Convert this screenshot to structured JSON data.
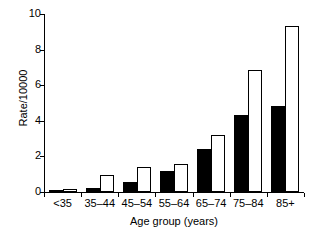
{
  "chart_data": {
    "type": "bar",
    "title": "",
    "xlabel": "Age group (years)",
    "ylabel": "Rate/10000",
    "categories": [
      "<35",
      "35–44",
      "45–54",
      "55–64",
      "65–74",
      "75–84",
      "85+"
    ],
    "series": [
      {
        "name": "black",
        "color": "#000000",
        "values": [
          0.05,
          0.25,
          0.55,
          1.2,
          2.4,
          4.35,
          4.85
        ]
      },
      {
        "name": "white",
        "color": "#ffffff",
        "values": [
          0.15,
          0.95,
          1.4,
          1.6,
          3.2,
          6.85,
          9.35
        ]
      }
    ],
    "ylim": [
      0,
      10
    ],
    "yticks": [
      0,
      2,
      4,
      6,
      8,
      10
    ],
    "ytick_labels": [
      "0",
      "2",
      "4",
      "6",
      "8",
      "10"
    ],
    "grid": false,
    "legend": "none",
    "axis_color": "#000000"
  }
}
